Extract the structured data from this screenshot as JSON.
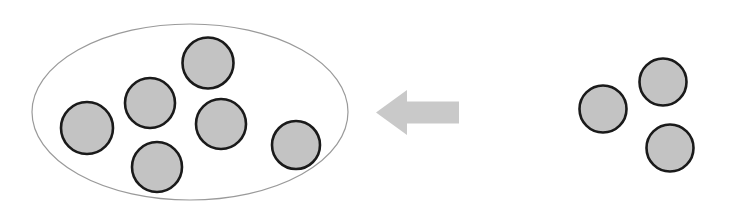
{
  "figure": {
    "type": "diagram",
    "title": "",
    "width": 747,
    "height": 207,
    "background_color": "#ffffff"
  },
  "style": {
    "circle_fill": "#c3c3c3",
    "circle_stroke": "#1a1a1a",
    "circle_stroke_width": 2.6,
    "ellipse_fill": "none",
    "ellipse_stroke": "#9a9a9a",
    "ellipse_stroke_width": 1.2,
    "arrow_fill": "#c9c9c9",
    "arrow_stroke": "none"
  },
  "group_container": {
    "name": "set-ellipse",
    "cx": 190,
    "cy": 112,
    "rx": 158,
    "ry": 88
  },
  "inner_circles": [
    {
      "name": "inner-circle-1",
      "cx": 87,
      "cy": 128,
      "r": 26
    },
    {
      "name": "inner-circle-2",
      "cx": 150,
      "cy": 103,
      "r": 25
    },
    {
      "name": "inner-circle-3",
      "cx": 208,
      "cy": 63,
      "r": 25.5
    },
    {
      "name": "inner-circle-4",
      "cx": 221,
      "cy": 124,
      "r": 25
    },
    {
      "name": "inner-circle-5",
      "cx": 157,
      "cy": 167,
      "r": 25
    },
    {
      "name": "inner-circle-6",
      "cx": 296,
      "cy": 145,
      "r": 24
    }
  ],
  "outer_circles": [
    {
      "name": "outer-circle-1",
      "cx": 603,
      "cy": 109,
      "r": 23.5
    },
    {
      "name": "outer-circle-2",
      "cx": 663,
      "cy": 82,
      "r": 23.5
    },
    {
      "name": "outer-circle-3",
      "cx": 670,
      "cy": 148,
      "r": 23.5
    }
  ],
  "arrow": {
    "name": "left-arrow",
    "direction": "left",
    "points": "376,112.5 407,90 407,101.5 459,101.5 459,123.5 407,123.5 407,135",
    "tip_x": 376,
    "tail_x": 459,
    "center_y": 112.5
  }
}
